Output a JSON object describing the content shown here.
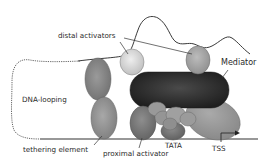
{
  "diagram": {
    "type": "transcription-initiation-schematic",
    "labels": {
      "distal_activators": "distal activators",
      "mediator": "Mediator",
      "dna_looping": "DNA-looping",
      "tethering_element": "tethering element",
      "proximal_activator": "proximal activator",
      "tata": "TATA",
      "tss": "TSS"
    },
    "colors": {
      "background": "#ffffff",
      "dna_line": "#333333",
      "mediator": "#2b2b2b",
      "distal_activator_1": "#d4d4d4",
      "distal_activator_2": "#a9a9a9",
      "tethering_element": "#8a8a8a",
      "proximal_activator": "#7f7f7f",
      "general_factors": "#9a9a9a",
      "pol_ii": "#9c9c9c",
      "text": "#2a2a2a"
    }
  }
}
